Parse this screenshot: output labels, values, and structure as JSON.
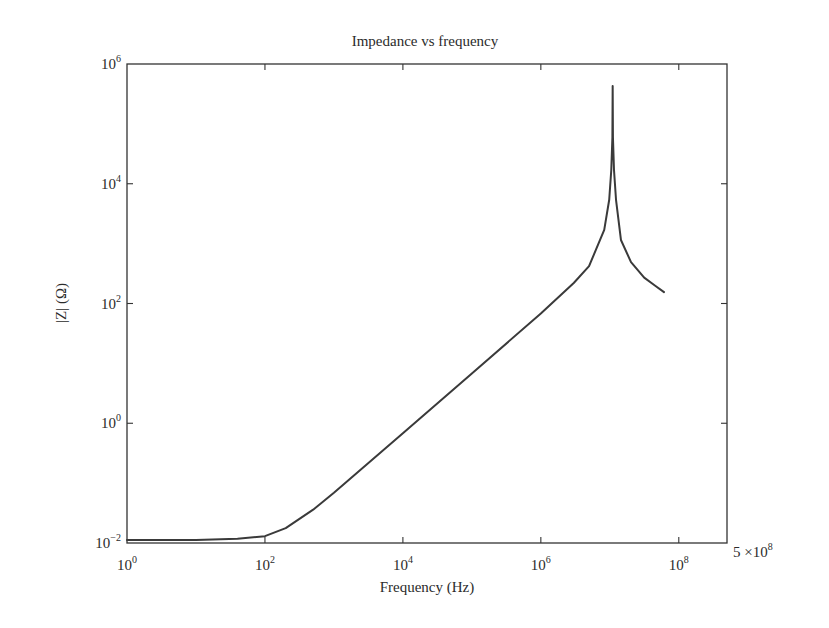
{
  "chart_data": {
    "type": "line",
    "title": "Impedance vs frequency",
    "xlabel": "Frequency (Hz)",
    "ylabel": "|Z| (Ω)",
    "xscale": "log",
    "yscale": "log",
    "xlim": [
      1,
      500000000
    ],
    "ylim": [
      0.01,
      1000000
    ],
    "grid": false,
    "legend": null,
    "x_ticks": [
      {
        "value": 1,
        "base": "10",
        "exp": "0"
      },
      {
        "value": 100,
        "base": "10",
        "exp": "2"
      },
      {
        "value": 10000,
        "base": "10",
        "exp": "4"
      },
      {
        "value": 1000000,
        "base": "10",
        "exp": "6"
      },
      {
        "value": 100000000,
        "base": "10",
        "exp": "8"
      }
    ],
    "x_end_label": {
      "value": 500000000,
      "mantissa": "5 ×",
      "base": "10",
      "exp": "8"
    },
    "y_ticks": [
      {
        "value": 0.01,
        "base": "10",
        "exp": "−2"
      },
      {
        "value": 1,
        "base": "10",
        "exp": "0"
      },
      {
        "value": 100,
        "base": "10",
        "exp": "2"
      },
      {
        "value": 10000,
        "base": "10",
        "exp": "4"
      },
      {
        "value": 1000000,
        "base": "10",
        "exp": "6"
      }
    ],
    "series": [
      {
        "name": "|Z|",
        "color": "#3a3a3a",
        "x": [
          1,
          10,
          40,
          100,
          200,
          500,
          1000,
          10000,
          100000,
          1000000,
          3000000,
          5000000,
          8300000,
          9800000,
          10500000,
          10900000,
          11000000,
          11100000,
          11500000,
          12300000,
          14500000,
          20300000,
          31500000,
          45000000,
          61000000
        ],
        "values": [
          0.0112,
          0.0112,
          0.0118,
          0.013,
          0.0177,
          0.036,
          0.069,
          0.68,
          6.8,
          68,
          220,
          420,
          1700,
          5400,
          17000,
          60000,
          430000,
          60000,
          17000,
          5400,
          1150,
          490,
          270,
          200,
          155
        ]
      }
    ]
  }
}
